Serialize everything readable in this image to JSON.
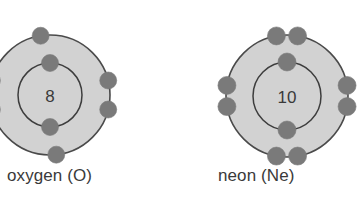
{
  "figure": {
    "background_color": "#ffffff",
    "width": 362,
    "height": 216
  },
  "colors": {
    "shell_fill": "#d2d2d2",
    "shell_stroke": "#4a4a4a",
    "inner_ring_stroke": "#3d3d3d",
    "electron_fill": "#7a7a7a",
    "text_color": "#3a3a3a"
  },
  "atoms": [
    {
      "id": "oxygen",
      "caption": "oxygen (O)",
      "element_name": "oxygen",
      "symbol": "O",
      "nucleus_label": "8",
      "atomic_number": 8,
      "center": {
        "x": 50,
        "y": 95
      },
      "outer_radius": 60,
      "inner_radius": 32,
      "electron_radius": 8.5,
      "clipped_at_left_edge": true,
      "inner_shell_electron_count": 2,
      "outer_shell_electron_count": 6,
      "inner_shell_electrons": [
        {
          "angle_deg": -90
        },
        {
          "angle_deg": 90
        }
      ],
      "outer_shell_electrons": [
        {
          "angle_deg": -99
        },
        {
          "angle_deg": 84
        },
        {
          "angle_deg": -14
        },
        {
          "angle_deg": 14
        },
        {
          "angle_deg": 194
        },
        {
          "angle_deg": 166
        }
      ]
    },
    {
      "id": "neon",
      "caption": "neon (Ne)",
      "element_name": "neon",
      "symbol": "Ne",
      "nucleus_label": "10",
      "atomic_number": 10,
      "center": {
        "x": 287,
        "y": 96
      },
      "outer_radius": 61,
      "inner_radius": 34,
      "electron_radius": 9,
      "clipped_at_left_edge": false,
      "inner_shell_electron_count": 2,
      "outer_shell_electron_count": 8,
      "inner_shell_electrons": [
        {
          "angle_deg": -90
        },
        {
          "angle_deg": 90
        }
      ],
      "outer_shell_electrons": [
        {
          "angle_deg": -100
        },
        {
          "angle_deg": -80
        },
        {
          "angle_deg": 80
        },
        {
          "angle_deg": 100
        },
        {
          "angle_deg": -10
        },
        {
          "angle_deg": 10
        },
        {
          "angle_deg": 190
        },
        {
          "angle_deg": 170
        }
      ]
    }
  ]
}
